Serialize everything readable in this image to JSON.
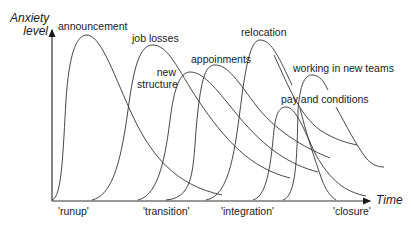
{
  "diagram": {
    "y_axis_label_line1": "Anxiety",
    "y_axis_label_line2": "level",
    "x_axis_label": "Time",
    "curves": [
      {
        "label": "announcement",
        "order": 1
      },
      {
        "label": "job losses",
        "order": 2
      },
      {
        "label_line1": "new",
        "label_line2": "structure",
        "order": 3
      },
      {
        "label": "appoinments",
        "order": 4
      },
      {
        "label": "relocation",
        "order": 5
      },
      {
        "label": "pay and conditions",
        "order": 6
      },
      {
        "label": "working in new teams",
        "order": 7
      }
    ],
    "phases": [
      "'runup'",
      "'transition'",
      "'integration'",
      "'closure'"
    ],
    "colors": {
      "line": "#333333",
      "text": "#1a1a1a",
      "background": "#ffffff"
    }
  }
}
